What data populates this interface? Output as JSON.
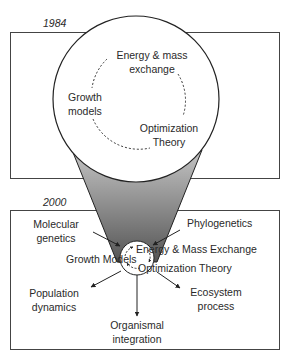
{
  "panel_1984": {
    "year": "1984",
    "topics": {
      "energy_line1": "Energy & mass",
      "energy_line2": "exchange",
      "growth_line1": "Growth",
      "growth_line2": "models",
      "optim_line1": "Optimization",
      "optim_line2": "Theory"
    }
  },
  "panel_2000": {
    "year": "2000",
    "core": {
      "energy": "Energy & Mass Exchange",
      "growth": "Growth Models",
      "optim": "Optimization Theory"
    },
    "inputs": {
      "molecular_line1": "Molecular",
      "molecular_line2": "genetics",
      "phylo": "Phylogenetics"
    },
    "outputs": {
      "population_line1": "Population",
      "population_line2": "dynamics",
      "organismal_line1": "Organismal",
      "organismal_line2": "integration",
      "ecosystem_line1": "Ecosystem",
      "ecosystem_line2": "process"
    }
  },
  "colors": {
    "stroke": "#222222",
    "cone_top": "#bdbdbd",
    "cone_bottom": "#5a5a5a",
    "background": "#ffffff"
  }
}
